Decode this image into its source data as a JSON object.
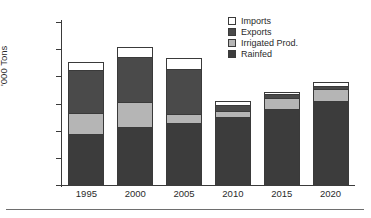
{
  "chart_data": {
    "type": "bar",
    "title": "",
    "subtitle": "",
    "xlabel": "",
    "ylabel": "'000 Tons",
    "stacked": true,
    "grid": false,
    "legend_position": "top-right",
    "ylim": [
      0,
      30000
    ],
    "ytick_values": [
      30000,
      25000,
      20000,
      15000,
      10000,
      5000,
      0
    ],
    "ytick_labels": [
      "30,000",
      "25,000",
      "20,000",
      "15,000",
      "10,000",
      "5,000",
      "0"
    ],
    "categories": [
      "1995",
      "2000",
      "2005",
      "2010",
      "2015",
      "2020"
    ],
    "series": [
      {
        "name": "Rainfed",
        "color": "#3c3c3c",
        "values": [
          9300,
          10700,
          11400,
          12600,
          13900,
          15400
        ]
      },
      {
        "name": "Irrigated Prod.",
        "color": "#b5b5b5",
        "values": [
          3900,
          4500,
          1600,
          1000,
          2200,
          2200
        ]
      },
      {
        "name": "Exports",
        "color": "#4a4a4a",
        "values": [
          8000,
          8400,
          8400,
          1100,
          600,
          600
        ]
      },
      {
        "name": "Imports",
        "color": "#ffffff",
        "values": [
          1400,
          1800,
          1900,
          700,
          400,
          800
        ]
      }
    ],
    "totals": [
      22600,
      25400,
      23300,
      15400,
      17100,
      19000
    ]
  },
  "axes": {
    "y_title": "'000 Tons",
    "y_ticks": [
      "30,000",
      "25,000",
      "20,000",
      "15,000",
      "10,000",
      "5,000",
      "0"
    ],
    "x_ticks": [
      "1995",
      "2000",
      "2005",
      "2010",
      "2015",
      "2020"
    ]
  },
  "legend": {
    "items": [
      {
        "label": "Imports",
        "color": "#ffffff"
      },
      {
        "label": "Exports",
        "color": "#4a4a4a"
      },
      {
        "label": "Irrigated Prod.",
        "color": "#b5b5b5"
      },
      {
        "label": "Rainfed",
        "color": "#3c3c3c"
      }
    ]
  }
}
